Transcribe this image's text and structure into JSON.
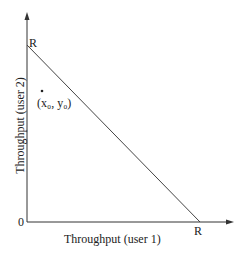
{
  "diagram": {
    "x_axis_label": "Throughput (user 1)",
    "y_axis_label": "Throughput (user 2)",
    "origin_label": "0",
    "y_intercept_label": "R",
    "x_intercept_label": "R",
    "point_label": "(x₀, y₀)",
    "colors": {
      "axis": "#333333",
      "line": "#444444",
      "text": "#222222"
    }
  }
}
